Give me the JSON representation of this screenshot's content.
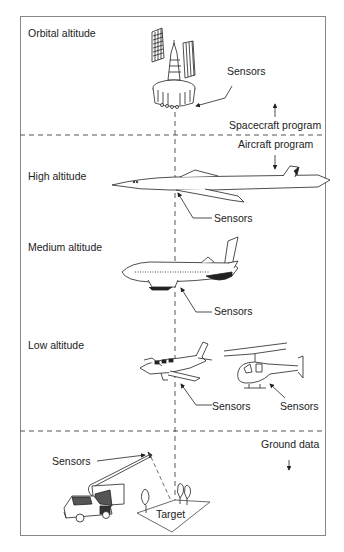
{
  "sections": {
    "orbital": {
      "label": "Orbital altitude"
    },
    "high": {
      "label": "High altitude"
    },
    "medium": {
      "label": "Medium altitude"
    },
    "low": {
      "label": "Low altitude"
    },
    "ground": {
      "label": "Ground data"
    }
  },
  "programs": {
    "spacecraft": "Spacecraft program",
    "aircraft": "Aircraft program"
  },
  "callouts": {
    "satellite_sensors": "Sensors",
    "jet_sensors": "Sensors",
    "airliner_sensors": "Sensors",
    "plane_sensors": "Sensors",
    "helicopter_sensors": "Sensors",
    "truck_sensors": "Sensors"
  },
  "target_label": "Target",
  "colors": {
    "line": "#333333",
    "frame": "#888888",
    "text": "#222222"
  }
}
